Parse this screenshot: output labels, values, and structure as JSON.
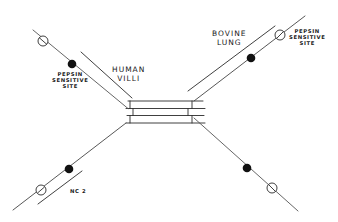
{
  "diagram": {
    "type": "molecular schematic",
    "labels": {
      "human_villi": [
        "HUMAN",
        "VILLI"
      ],
      "bovine_lung": [
        "BOVINE",
        "LUNG"
      ],
      "pepsin_left": [
        "PEPSIN",
        "SENSITIVE",
        "SITE"
      ],
      "pepsin_right": [
        "PEPSIN",
        "SENSITIVE",
        "SITE"
      ],
      "nc2": "NC 2"
    },
    "legend": {
      "filled_circle": "pepsin sensitive site",
      "open_circle": "cleavage marker"
    },
    "colors": {
      "line": "#2a2a2a",
      "background": "#ffffff"
    }
  }
}
